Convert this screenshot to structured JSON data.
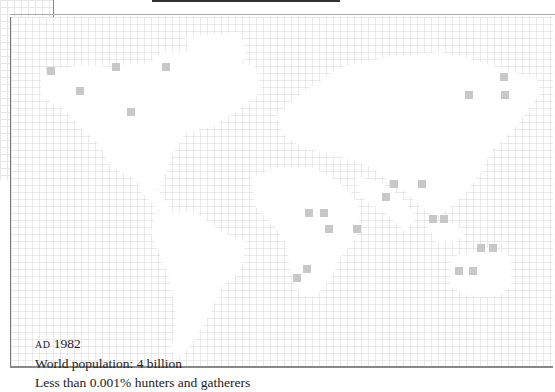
{
  "caption": {
    "era_prefix": "AD",
    "year": "1982",
    "population": "World population: 4 billion",
    "hunters": "Less than 0.001% hunters and gatherers"
  },
  "map": {
    "grid_size_px": 7,
    "grid_color": "#d8d8d8",
    "marker_color": "#c8c8c8",
    "markers": [
      [
        46,
        67
      ],
      [
        75,
        87
      ],
      [
        111,
        63
      ],
      [
        161,
        63
      ],
      [
        126,
        108
      ],
      [
        499,
        73
      ],
      [
        500,
        91
      ],
      [
        464,
        91
      ],
      [
        389,
        180
      ],
      [
        417,
        180
      ],
      [
        381,
        193
      ],
      [
        304,
        209
      ],
      [
        319,
        209
      ],
      [
        352,
        225
      ],
      [
        324,
        225
      ],
      [
        428,
        215
      ],
      [
        439,
        215
      ],
      [
        476,
        244
      ],
      [
        488,
        244
      ],
      [
        454,
        267
      ],
      [
        468,
        267
      ],
      [
        292,
        274
      ],
      [
        302,
        265
      ]
    ]
  }
}
